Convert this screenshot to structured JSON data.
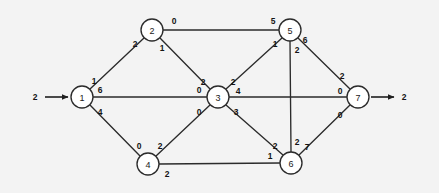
{
  "diagram": {
    "type": "directed-network-flow-graph",
    "background_color": "#f3f3f3",
    "line_color": "#2b2b2b",
    "node_fill": "#ffffff",
    "nodes": [
      {
        "id": "1",
        "label": "1",
        "cx": 82,
        "cy": 97,
        "r": 11
      },
      {
        "id": "2",
        "label": "2",
        "cx": 152,
        "cy": 30,
        "r": 11
      },
      {
        "id": "3",
        "label": "3",
        "cx": 218,
        "cy": 97,
        "r": 11
      },
      {
        "id": "4",
        "label": "4",
        "cx": 148,
        "cy": 164,
        "r": 11
      },
      {
        "id": "5",
        "label": "5",
        "cx": 290,
        "cy": 30,
        "r": 11
      },
      {
        "id": "6",
        "label": "6",
        "cx": 291,
        "cy": 163,
        "r": 11
      },
      {
        "id": "7",
        "label": "7",
        "cx": 358,
        "cy": 97,
        "r": 11
      }
    ],
    "edges": [
      {
        "from": "1",
        "to": "2",
        "x1": 90,
        "y1": 89,
        "x2": 144,
        "y2": 38
      },
      {
        "from": "2",
        "to": "5",
        "x1": 163,
        "y1": 30,
        "x2": 279,
        "y2": 30
      },
      {
        "from": "2",
        "to": "3",
        "x1": 160,
        "y1": 38,
        "x2": 210,
        "y2": 89
      },
      {
        "from": "1",
        "to": "3",
        "x1": 93,
        "y1": 97,
        "x2": 207,
        "y2": 97
      },
      {
        "from": "1",
        "to": "4",
        "x1": 90,
        "y1": 105,
        "x2": 140,
        "y2": 156
      },
      {
        "from": "4",
        "to": "3",
        "x1": 156,
        "y1": 156,
        "x2": 210,
        "y2": 105
      },
      {
        "from": "4",
        "to": "6",
        "x1": 159,
        "y1": 164,
        "x2": 280,
        "y2": 163
      },
      {
        "from": "3",
        "to": "5",
        "x1": 226,
        "y1": 89,
        "x2": 282,
        "y2": 38
      },
      {
        "from": "3",
        "to": "7",
        "x1": 229,
        "y1": 97,
        "x2": 347,
        "y2": 97
      },
      {
        "from": "3",
        "to": "6",
        "x1": 226,
        "y1": 105,
        "x2": 283,
        "y2": 155
      },
      {
        "from": "5",
        "to": "6",
        "x1": 290,
        "y1": 41,
        "x2": 291,
        "y2": 152
      },
      {
        "from": "5",
        "to": "7",
        "x1": 298,
        "y1": 38,
        "x2": 350,
        "y2": 89
      },
      {
        "from": "6",
        "to": "7",
        "x1": 299,
        "y1": 155,
        "x2": 350,
        "y2": 105
      }
    ],
    "edge_labels": [
      {
        "id": "label-1-2-near1",
        "text": "1",
        "x": 94,
        "y": 81
      },
      {
        "id": "label-1-2-near2",
        "text": "2",
        "x": 135,
        "y": 44
      },
      {
        "id": "label-2-5-near2",
        "text": "0",
        "x": 174,
        "y": 21
      },
      {
        "id": "label-2-5-near5",
        "text": "5",
        "x": 273,
        "y": 21
      },
      {
        "id": "label-2-3-near2",
        "text": "1",
        "x": 162,
        "y": 48
      },
      {
        "id": "label-2-3-near3",
        "text": "2",
        "x": 203,
        "y": 82
      },
      {
        "id": "label-1-3-near1",
        "text": "6",
        "x": 100,
        "y": 90
      },
      {
        "id": "label-1-3-near3",
        "text": "0",
        "x": 199,
        "y": 90
      },
      {
        "id": "label-1-4-near1",
        "text": "4",
        "x": 100,
        "y": 112
      },
      {
        "id": "label-1-4-near4",
        "text": "0",
        "x": 139,
        "y": 146
      },
      {
        "id": "label-4-3-near4",
        "text": "2",
        "x": 160,
        "y": 146
      },
      {
        "id": "label-4-3-near3",
        "text": "0",
        "x": 199,
        "y": 112
      },
      {
        "id": "label-4-6-near4",
        "text": "2",
        "x": 167,
        "y": 174
      },
      {
        "id": "label-3-5-near3",
        "text": "2",
        "x": 233,
        "y": 82
      },
      {
        "id": "label-3-5-near5",
        "text": "1",
        "x": 275,
        "y": 44
      },
      {
        "id": "label-3-7-near3",
        "text": "4",
        "x": 238,
        "y": 91
      },
      {
        "id": "label-3-7-near7",
        "text": "0",
        "x": 340,
        "y": 91
      },
      {
        "id": "label-3-6-near3",
        "text": "3",
        "x": 236,
        "y": 112
      },
      {
        "id": "label-3-6-near6",
        "text": "2",
        "x": 275,
        "y": 146
      },
      {
        "id": "label-5-6-near5",
        "text": "2",
        "x": 297,
        "y": 50
      },
      {
        "id": "label-5-6-near6",
        "text": "2",
        "x": 297,
        "y": 142
      },
      {
        "id": "label-5-7-near5",
        "text": "6",
        "x": 305,
        "y": 40
      },
      {
        "id": "label-5-7-near7",
        "text": "2",
        "x": 342,
        "y": 76
      },
      {
        "id": "label-6-7-near6",
        "text": "7",
        "x": 307,
        "y": 147
      },
      {
        "id": "label-6-7-near7",
        "text": "0",
        "x": 340,
        "y": 115
      },
      {
        "id": "label-6-4-near6",
        "text": "1",
        "x": 270,
        "y": 156
      }
    ],
    "source_flow": {
      "label": "2",
      "label_x": 35,
      "label_y": 97,
      "arrow_x1": 45,
      "arrow_x2": 68,
      "arrow_y": 97
    },
    "sink_flow": {
      "label": "2",
      "label_x": 404,
      "label_y": 97,
      "arrow_x1": 371,
      "arrow_x2": 394,
      "arrow_y": 97
    }
  }
}
